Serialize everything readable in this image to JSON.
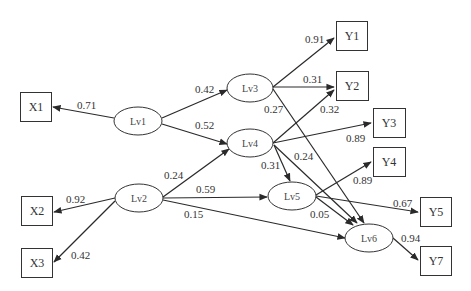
{
  "diagram": {
    "type": "path-model",
    "latent_nodes": [
      {
        "id": "Lv1",
        "label": "Lv1",
        "cx": 138,
        "cy": 121
      },
      {
        "id": "Lv2",
        "label": "Lv2",
        "cx": 138,
        "cy": 198
      },
      {
        "id": "Lv3",
        "label": "Lv3",
        "cx": 250,
        "cy": 88
      },
      {
        "id": "Lv4",
        "label": "Lv4",
        "cx": 250,
        "cy": 143
      },
      {
        "id": "Lv5",
        "label": "Lv5",
        "cx": 292,
        "cy": 196
      },
      {
        "id": "Lv6",
        "label": "Lv6",
        "cx": 369,
        "cy": 238
      }
    ],
    "observed_nodes": [
      {
        "id": "X1",
        "label": "X1",
        "x": 20,
        "y": 92
      },
      {
        "id": "X2",
        "label": "X2",
        "x": 21,
        "y": 196
      },
      {
        "id": "X3",
        "label": "X3",
        "x": 21,
        "y": 248
      },
      {
        "id": "Y1",
        "label": "Y1",
        "x": 336,
        "y": 21
      },
      {
        "id": "Y2",
        "label": "Y2",
        "x": 336,
        "y": 71
      },
      {
        "id": "Y3",
        "label": "Y3",
        "x": 373,
        "y": 108
      },
      {
        "id": "Y4",
        "label": "Y4",
        "x": 373,
        "y": 147
      },
      {
        "id": "Y5",
        "label": "Y5",
        "x": 420,
        "y": 197
      },
      {
        "id": "Y7",
        "label": "Y7",
        "x": 420,
        "y": 246
      }
    ],
    "edges": [
      {
        "from": "Lv1",
        "to": "X1",
        "weight": "0.71"
      },
      {
        "from": "Lv1",
        "to": "Lv3",
        "weight": "0.42"
      },
      {
        "from": "Lv1",
        "to": "Lv4",
        "weight": "0.52"
      },
      {
        "from": "Lv2",
        "to": "X2",
        "weight": "0.92"
      },
      {
        "from": "Lv2",
        "to": "X3",
        "weight": "0.42"
      },
      {
        "from": "Lv2",
        "to": "Lv4",
        "weight": "0.24"
      },
      {
        "from": "Lv2",
        "to": "Lv5",
        "weight": "0.59"
      },
      {
        "from": "Lv2",
        "to": "Lv6",
        "weight": "0.15"
      },
      {
        "from": "Lv3",
        "to": "Y1",
        "weight": "0.91"
      },
      {
        "from": "Lv3",
        "to": "Y2",
        "weight": "0.31"
      },
      {
        "from": "Lv3",
        "to": "Lv6",
        "weight": "0.27"
      },
      {
        "from": "Lv4",
        "to": "Y2",
        "weight": "0.32"
      },
      {
        "from": "Lv4",
        "to": "Y3",
        "weight": "0.89"
      },
      {
        "from": "Lv4",
        "to": "Lv5",
        "weight": "0.31"
      },
      {
        "from": "Lv4",
        "to": "Lv6",
        "weight": "0.24"
      },
      {
        "from": "Lv5",
        "to": "Y4",
        "weight": "0.89"
      },
      {
        "from": "Lv5",
        "to": "Y5",
        "weight": "0.67"
      },
      {
        "from": "Lv5",
        "to": "Lv6",
        "weight": "0.05"
      },
      {
        "from": "Lv6",
        "to": "Y7",
        "weight": "0.94"
      }
    ]
  },
  "labels": {
    "lv1": "Lv1",
    "lv2": "Lv2",
    "lv3": "Lv3",
    "lv4": "Lv4",
    "lv5": "Lv5",
    "lv6": "Lv6",
    "x1": "X1",
    "x2": "X2",
    "x3": "X3",
    "y1": "Y1",
    "y2": "Y2",
    "y3": "Y3",
    "y4": "Y4",
    "y5": "Y5",
    "y7": "Y7",
    "w_lv1_x1": "0.71",
    "w_lv1_lv3": "0.42",
    "w_lv1_lv4": "0.52",
    "w_lv2_x2": "0.92",
    "w_lv2_x3": "0.42",
    "w_lv2_lv4": "0.24",
    "w_lv2_lv5": "0.59",
    "w_lv2_lv6": "0.15",
    "w_lv3_y1": "0.91",
    "w_lv3_y2": "0.31",
    "w_lv3_lv6": "0.27",
    "w_lv4_y2": "0.32",
    "w_lv4_y3": "0.89",
    "w_lv4_lv5": "0.31",
    "w_lv4_lv6": "0.24",
    "w_lv5_y4": "0.89",
    "w_lv5_y5": "0.67",
    "w_lv5_lv6": "0.05",
    "w_lv6_y7": "0.94"
  }
}
